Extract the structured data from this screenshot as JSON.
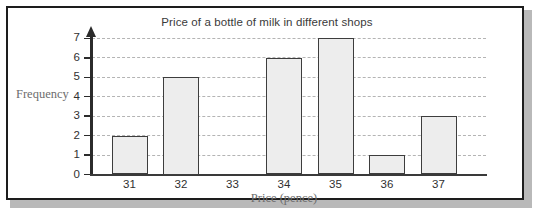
{
  "chart_data": {
    "type": "bar",
    "title": "Price of a bottle of milk in different shops",
    "xlabel": "Price (pence)",
    "ylabel": "Frequency",
    "categories": [
      "31",
      "32",
      "33",
      "34",
      "35",
      "36",
      "37"
    ],
    "values": [
      2,
      5,
      0,
      6,
      7,
      1,
      3
    ],
    "ylim": [
      0,
      7
    ],
    "yticks": [
      "0",
      "1",
      "2",
      "3",
      "4",
      "5",
      "6",
      "7"
    ],
    "grid": true,
    "legend": "none",
    "colors": {
      "bar_fill": "#ededed",
      "bar_stroke": "#3d3d3d",
      "axis": "#2b2b2b",
      "gridline": "#b4b4b4",
      "title_text": "#3a3a3a",
      "axis_title_text": "#6d6d6d",
      "frame": "#1d1d1d"
    }
  }
}
